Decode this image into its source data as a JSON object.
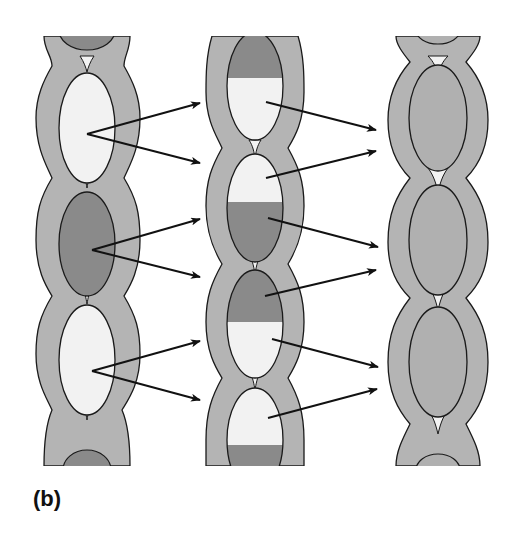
{
  "figure": {
    "panel_label": "(b)",
    "colors": {
      "wall_fill": "#b4b4b4",
      "light_fill": "#f2f2f2",
      "dark_fill": "#8a8a8a",
      "mid_fill": "#b0b0b0",
      "outline": "#1a1a1a",
      "arrow": "#111111"
    },
    "columns": [
      {
        "name": "left-column",
        "cells": [
          "dark-partial-top",
          "light",
          "dark",
          "light",
          "dark-partial-bottom"
        ]
      },
      {
        "name": "middle-column",
        "cells": [
          "dark-top-light-bottom",
          "light-top-dark-bottom",
          "dark-top-light-bottom",
          "light-top-dark-bottom"
        ]
      },
      {
        "name": "right-column",
        "cells": [
          "uniform",
          "uniform",
          "uniform"
        ]
      }
    ],
    "arrows_left_to_middle": 6,
    "arrows_middle_to_right": 6
  }
}
